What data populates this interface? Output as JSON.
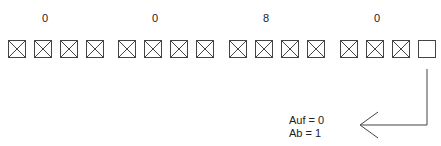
{
  "groups": [
    {
      "value": "0",
      "bits": [
        1,
        1,
        1,
        1
      ]
    },
    {
      "value": "0",
      "bits": [
        1,
        1,
        1,
        1
      ]
    },
    {
      "value": "8",
      "bits": [
        1,
        1,
        1,
        1
      ]
    },
    {
      "value": "0",
      "bits": [
        1,
        1,
        1,
        0
      ]
    }
  ],
  "legend": {
    "line1": "Auf =  0",
    "line2": "Ab  =  1"
  }
}
